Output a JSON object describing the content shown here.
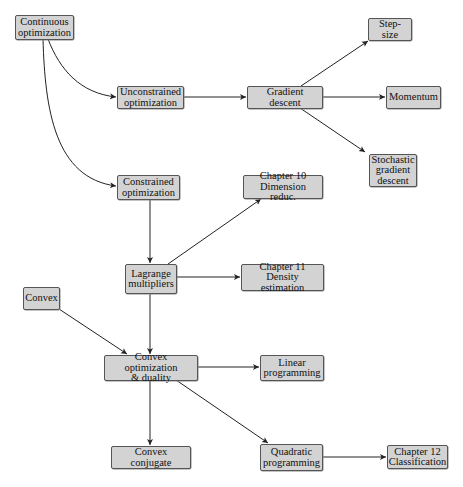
{
  "nodes": {
    "continuous": {
      "label": "Continuous\noptimization"
    },
    "unconstrained": {
      "label": "Unconstrained\noptimization"
    },
    "gradient": {
      "label": "Gradient descent"
    },
    "stepsize": {
      "label": "Step-size"
    },
    "momentum": {
      "label": "Momentum"
    },
    "stochastic": {
      "label": "Stochastic\ngradient\ndescent"
    },
    "constrained": {
      "label": "Constrained\noptimization"
    },
    "ch10": {
      "label": "Chapter 10\nDimension reduc."
    },
    "lagrange": {
      "label": "Lagrange\nmultipliers"
    },
    "ch11": {
      "label": "Chapter 11\nDensity estimation"
    },
    "convex": {
      "label": "Convex"
    },
    "convexopt": {
      "label": "Convex optimization\n& duality"
    },
    "linear": {
      "label": "Linear\nprogramming"
    },
    "conjugate": {
      "label": "Convex conjugate"
    },
    "quadratic": {
      "label": "Quadratic\nprogramming"
    },
    "ch12": {
      "label": "Chapter 12\nClassification"
    }
  },
  "edges": [
    {
      "from": "Continuous optimization",
      "to": "Unconstrained optimization"
    },
    {
      "from": "Continuous optimization",
      "to": "Constrained optimization"
    },
    {
      "from": "Unconstrained optimization",
      "to": "Gradient descent"
    },
    {
      "from": "Gradient descent",
      "to": "Step-size"
    },
    {
      "from": "Gradient descent",
      "to": "Momentum"
    },
    {
      "from": "Gradient descent",
      "to": "Stochastic gradient descent"
    },
    {
      "from": "Constrained optimization",
      "to": "Lagrange multipliers"
    },
    {
      "from": "Lagrange multipliers",
      "to": "Chapter 10 Dimension reduc."
    },
    {
      "from": "Lagrange multipliers",
      "to": "Chapter 11 Density estimation"
    },
    {
      "from": "Lagrange multipliers",
      "to": "Convex optimization & duality"
    },
    {
      "from": "Convex",
      "to": "Convex optimization & duality"
    },
    {
      "from": "Convex optimization & duality",
      "to": "Linear programming"
    },
    {
      "from": "Convex optimization & duality",
      "to": "Convex conjugate"
    },
    {
      "from": "Convex optimization & duality",
      "to": "Quadratic programming"
    },
    {
      "from": "Quadratic programming",
      "to": "Chapter 12 Classification"
    }
  ],
  "colors": {
    "node_fill": "#d3d3d3",
    "node_border": "#555555",
    "edge": "#222222"
  }
}
